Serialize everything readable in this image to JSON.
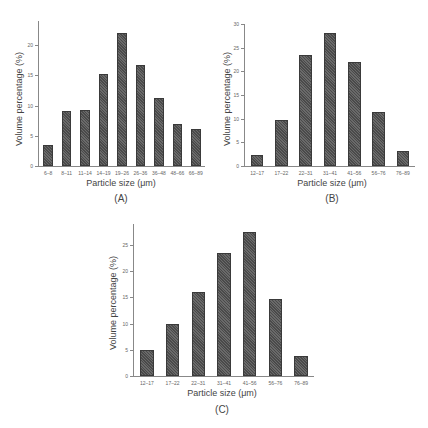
{
  "chart_data": [
    {
      "id": "A",
      "type": "bar",
      "caption": "(A)",
      "xlabel": "Particle size (μm)",
      "ylabel": "Volume percentage (%)",
      "categories": [
        "6–8",
        "8–11",
        "11–14",
        "14–19",
        "19–26",
        "26–36",
        "36–48",
        "48–66",
        "66–89"
      ],
      "values": [
        3.5,
        9.1,
        9.2,
        15.3,
        22.0,
        16.8,
        11.3,
        7.0,
        6.2
      ],
      "ylim": [
        0,
        24
      ],
      "yticks": [
        0,
        5,
        10,
        15,
        20
      ],
      "grid": false,
      "legend": null
    },
    {
      "id": "B",
      "type": "bar",
      "caption": "(B)",
      "xlabel": "Particle size (μm)",
      "ylabel": "Volume percentage (%)",
      "categories": [
        "12–17",
        "17–22",
        "22–31",
        "31–41",
        "41–56",
        "56–76",
        "76–89"
      ],
      "values": [
        2.4,
        9.8,
        23.4,
        28.0,
        22.0,
        11.4,
        3.1
      ],
      "ylim": [
        0,
        30
      ],
      "yticks": [
        0,
        5,
        10,
        15,
        20,
        25,
        30
      ],
      "grid": false,
      "legend": null
    },
    {
      "id": "C",
      "type": "bar",
      "caption": "(C)",
      "xlabel": "Particle size (μm)",
      "ylabel": "Volume percentage (%)",
      "categories": [
        "12–17",
        "17–22",
        "22–31",
        "31–41",
        "41–56",
        "56–76",
        "76–89"
      ],
      "values": [
        5.0,
        10.0,
        16.1,
        23.5,
        27.4,
        14.6,
        3.9
      ],
      "ylim": [
        0,
        29
      ],
      "yticks": [
        0,
        5,
        10,
        15,
        20,
        25
      ],
      "grid": false,
      "legend": null
    }
  ],
  "colors": {
    "bar_fill": "#555555",
    "axis": "#888888",
    "text": "#444444"
  }
}
